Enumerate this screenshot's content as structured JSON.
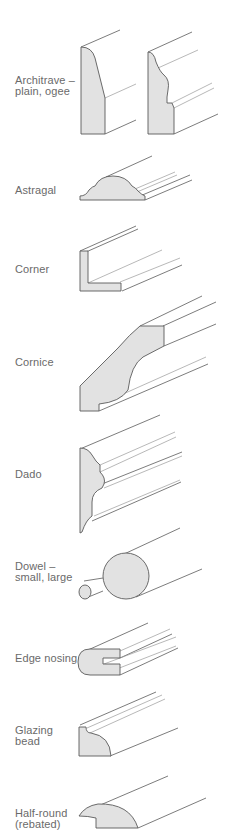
{
  "items": [
    {
      "name": "architrave",
      "label": "Architrave –\nplain, ogee"
    },
    {
      "name": "astragal",
      "label": "Astragal"
    },
    {
      "name": "corner",
      "label": "Corner"
    },
    {
      "name": "cornice",
      "label": "Cornice"
    },
    {
      "name": "dado",
      "label": "Dado"
    },
    {
      "name": "dowel",
      "label": "Dowel –\nsmall, large"
    },
    {
      "name": "edge-nosing",
      "label": "Edge nosing"
    },
    {
      "name": "glazing-bead",
      "label": "Glazing\nbead"
    },
    {
      "name": "half-round",
      "label": "Half-round\n(rebated)"
    }
  ],
  "colors": {
    "section_fill": "#e2e2e2",
    "outline": "#5a5a5a",
    "text": "#6a6a6a"
  }
}
